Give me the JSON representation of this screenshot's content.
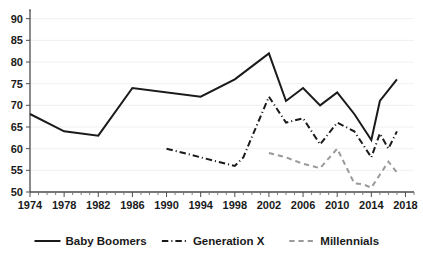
{
  "chart_data": {
    "type": "line",
    "title": "",
    "subtitle": "",
    "xlabel": "",
    "ylabel": "",
    "xlim": [
      1974,
      2019
    ],
    "ylim": [
      50,
      92
    ],
    "grid": true,
    "legend_position": "bottom",
    "y_ticks": [
      50,
      55,
      60,
      65,
      70,
      75,
      80,
      85,
      90
    ],
    "x_ticks": [
      1974,
      1978,
      1982,
      1986,
      1990,
      1994,
      1998,
      2002,
      2006,
      2010,
      2014,
      2018
    ],
    "x_minor_tick_step": 1,
    "series": [
      {
        "name": "Baby Boomers",
        "style": "solid",
        "color": "#1a1a1a",
        "x": [
          1974,
          1978,
          1982,
          1986,
          1994,
          1998,
          2000,
          2002,
          2004,
          2006,
          2008,
          2010,
          2012,
          2014,
          2015,
          2017
        ],
        "values": [
          68,
          64,
          63,
          74,
          72,
          76,
          79,
          82,
          71,
          74,
          70,
          73,
          68,
          62,
          71,
          76
        ]
      },
      {
        "name": "Generation X",
        "style": "dash-dot",
        "color": "#1a1a1a",
        "x": [
          1990,
          1994,
          1998,
          1999,
          2002,
          2004,
          2005,
          2006,
          2008,
          2010,
          2012,
          2014,
          2015,
          2016,
          2017
        ],
        "values": [
          60,
          58,
          56,
          58,
          72,
          66,
          66.5,
          67,
          61,
          66,
          64,
          58,
          63.5,
          60,
          64
        ]
      },
      {
        "name": "Millennials",
        "style": "dashed",
        "color": "#9a9a9a",
        "x": [
          2002,
          2004,
          2006,
          2008,
          2010,
          2012,
          2013,
          2014,
          2016,
          2017
        ],
        "values": [
          59,
          58,
          56.5,
          55.5,
          60,
          52,
          51.8,
          51,
          57,
          54.5
        ]
      }
    ],
    "legend": [
      {
        "label": "Baby Boomers",
        "style": "solid",
        "color": "#1a1a1a"
      },
      {
        "label": "Generation X",
        "style": "dash-dot",
        "color": "#1a1a1a"
      },
      {
        "label": "Millennials",
        "style": "dashed",
        "color": "#9a9a9a"
      }
    ]
  }
}
